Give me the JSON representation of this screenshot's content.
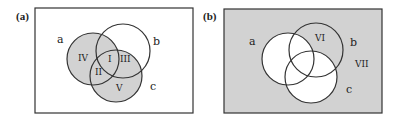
{
  "colors": {
    "shade": "#d2d2d2",
    "stroke": "#333333",
    "background": "#ffffff",
    "text": "#222222"
  },
  "panels": [
    {
      "id": "a",
      "label": "(a)",
      "label_pos": [
        16,
        20
      ],
      "rect": {
        "x": 35,
        "y": 8,
        "w": 158,
        "h": 105
      },
      "rect_fill": "#ffffff",
      "circles": {
        "a": {
          "cx": 93,
          "cy": 59,
          "r": 26
        },
        "b": {
          "cx": 123,
          "cy": 51,
          "r": 27
        },
        "c": {
          "cx": 116,
          "cy": 76,
          "r": 26
        }
      },
      "set_labels": [
        {
          "text": "a",
          "x": 57,
          "y": 43
        },
        {
          "text": "b",
          "x": 153,
          "y": 45
        },
        {
          "text": "c",
          "x": 150,
          "y": 90
        }
      ],
      "region_labels": [
        {
          "text": "IV",
          "x": 78,
          "y": 61
        },
        {
          "text": "I",
          "x": 108,
          "y": 62
        },
        {
          "text": "III",
          "x": 120,
          "y": 62
        },
        {
          "text": "II",
          "x": 95,
          "y": 75
        },
        {
          "text": "V",
          "x": 116,
          "y": 91
        }
      ],
      "shaded_description": "a union c shaded (regions I, II, III, IV, V)"
    },
    {
      "id": "b",
      "label": "(b)",
      "label_pos": [
        203,
        20
      ],
      "rect": {
        "x": 224,
        "y": 9,
        "w": 158,
        "h": 104
      },
      "rect_fill": "#d2d2d2",
      "circles": {
        "a": {
          "cx": 288,
          "cy": 59,
          "r": 26
        },
        "b": {
          "cx": 316,
          "cy": 50,
          "r": 27
        },
        "c": {
          "cx": 311,
          "cy": 77,
          "r": 26
        }
      },
      "set_labels": [
        {
          "text": "a",
          "x": 249,
          "y": 45
        },
        {
          "text": "b",
          "x": 350,
          "y": 46
        },
        {
          "text": "c",
          "x": 346,
          "y": 93
        }
      ],
      "region_labels": [
        {
          "text": "VI",
          "x": 315,
          "y": 41
        },
        {
          "text": "VII",
          "x": 355,
          "y": 67
        }
      ],
      "shaded_description": "complement of (a union c) shaded (regions VI, VII)"
    }
  ]
}
